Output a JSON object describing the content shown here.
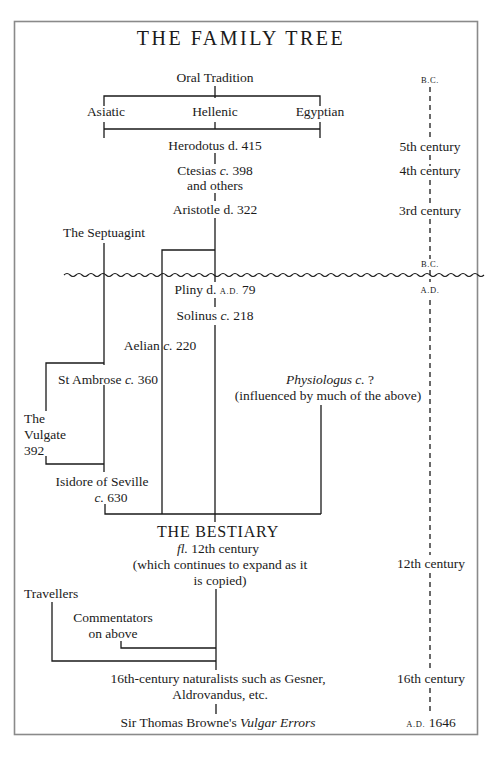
{
  "title": "THE FAMILY TREE",
  "nodes": {
    "oral_tradition": "Oral Tradition",
    "asiatic": "Asiatic",
    "hellenic": "Hellenic",
    "egyptian": "Egyptian",
    "herodotus": "Herodotus d. 415",
    "ctesias_name": "Ctesias ",
    "ctesias_c": "c.",
    "ctesias_date": " 398",
    "ctesias_line2": "and others",
    "aristotle": "Aristotle d. 322",
    "septuagint": "The Septuagint",
    "pliny_name": "Pliny d. ",
    "pliny_era": "A.D.",
    "pliny_date": " 79",
    "solinus_name": "Solinus ",
    "solinus_c": "c.",
    "solinus_date": " 218",
    "aelian_name": "Aelian ",
    "aelian_c": "c.",
    "aelian_date": " 220",
    "ambrose_name": "St Ambrose ",
    "ambrose_c": "c.",
    "ambrose_date": " 360",
    "physiologus_name": "Physiologus c.",
    "physiologus_date": "  ?",
    "physiologus_note": "(influenced by much of the above)",
    "vulgate_line1": "The",
    "vulgate_line2": "Vulgate",
    "vulgate_line3": "392",
    "isidore_line1": "Isidore of Seville",
    "isidore_c": "c.",
    "isidore_date": " 630",
    "bestiary_title": "THE BESTIARY",
    "bestiary_fl": "fl.",
    "bestiary_century": " 12th century",
    "bestiary_note1": "(which continues to expand as it",
    "bestiary_note2": "is copied)",
    "travellers": "Travellers",
    "commentators_line1": "Commentators",
    "commentators_line2": "on above",
    "naturalists_line1": "16th-century naturalists such as Gesner,",
    "naturalists_line2": "Aldrovandus, etc.",
    "browne_name": "Sir Thomas Browne's ",
    "browne_work": "Vulgar Errors"
  },
  "timeline": {
    "bc_top": "B.C.",
    "c5": "5th century",
    "c4": "4th century",
    "c3": "3rd century",
    "bc_divider": "B.C.",
    "ad_divider": "A.D.",
    "c12": "12th century",
    "c16": "16th century",
    "end_era": "A.D.",
    "end_year": " 1646"
  }
}
